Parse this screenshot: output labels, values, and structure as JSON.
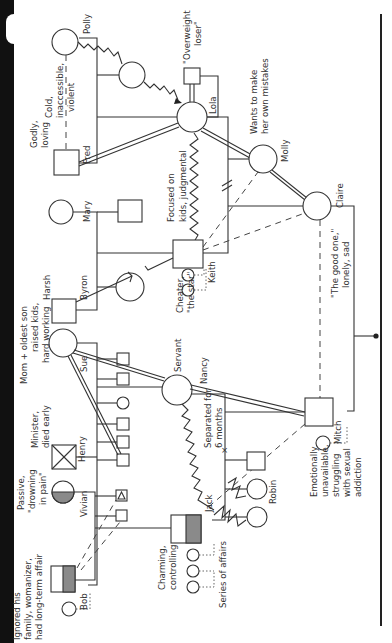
{
  "diagram": {
    "type": "genogram",
    "orientation": "rotated-90-ccw",
    "people": {
      "bob": {
        "name": "Bob",
        "note": [
          "Ignored his",
          "family, womanizer,",
          "had long-term affair"
        ]
      },
      "vivian": {
        "name": "Vivian",
        "note": [
          "Passive,",
          "\"drowning",
          "in pain\""
        ]
      },
      "henry": {
        "name": "Henry",
        "note": [
          "Minister,",
          "died early"
        ]
      },
      "sue": {
        "name": "Sue",
        "note": [
          "Mom + oldest son",
          "raised kids,",
          "hard working"
        ]
      },
      "harsh": {
        "name": "Harsh",
        "note": []
      },
      "byron": {
        "name": "Byron",
        "note": []
      },
      "mary": {
        "name": "Mary",
        "note": []
      },
      "fred": {
        "name": "Fred",
        "note": [
          "Godly,",
          "loving"
        ]
      },
      "polly": {
        "name": "Polly",
        "note": []
      },
      "cold": {
        "name": "",
        "note": [
          "Cold,",
          "inaccessible,",
          "violent"
        ]
      },
      "overweight": {
        "name": "",
        "note": [
          "\"Overweight",
          "loser\""
        ]
      },
      "lola": {
        "name": "Lola",
        "note": []
      },
      "keith": {
        "name": "Keith",
        "note": [
          "Cheater,",
          "\"the star\""
        ]
      },
      "focused": {
        "name": "",
        "note": [
          "Focused on",
          "kids, judgmental"
        ]
      },
      "molly": {
        "name": "Molly",
        "note": [
          "Wants to make",
          "her own mistakes"
        ]
      },
      "claire": {
        "name": "Claire",
        "note": [
          "\"The good one,\"",
          "lonely, sad"
        ]
      },
      "jack": {
        "name": "Jack",
        "note": [
          "Charming,",
          "controlling"
        ]
      },
      "nancy": {
        "name": "Nancy",
        "note": [
          "Servant"
        ]
      },
      "mitch": {
        "name": "Mitch",
        "note": [
          "Emotionally",
          "unavailable,",
          "struggling",
          "with sexual",
          "addiction"
        ]
      },
      "robin": {
        "name": "Robin",
        "note": []
      }
    },
    "annotations": {
      "separated": [
        "Separated for",
        "6 months"
      ],
      "affairs": "Series of affairs"
    }
  }
}
